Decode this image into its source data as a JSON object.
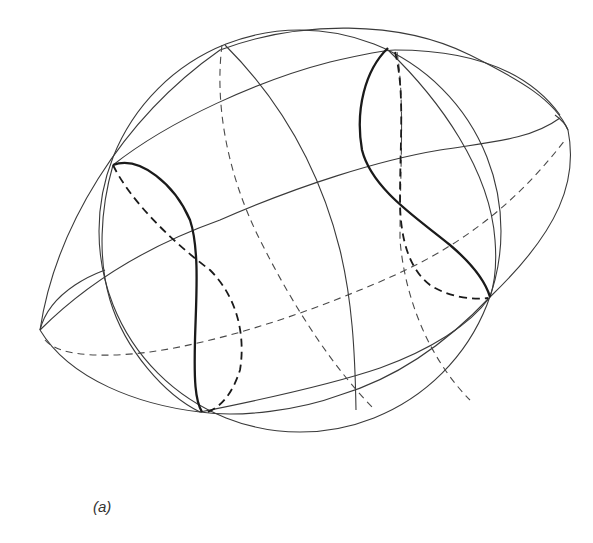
{
  "figure": {
    "caption": "(a)",
    "colors": {
      "background": "#ffffff",
      "line": "#3a3a3a",
      "bold_line": "#1a1a1a"
    },
    "elements": [
      {
        "name": "sphere-outline",
        "style": "solid-thin"
      },
      {
        "name": "ellipsoid-outline",
        "style": "solid-thin"
      },
      {
        "name": "sphere-meridian-front",
        "style": "solid-thin"
      },
      {
        "name": "sphere-meridian-back",
        "style": "dashed-thin"
      },
      {
        "name": "ellipsoid-latitude-lines",
        "style": "solid-thin"
      },
      {
        "name": "ellipsoid-equator-back",
        "style": "dashed-thin"
      },
      {
        "name": "intersection-curve-left",
        "style": "solid-bold + dashed-bold"
      },
      {
        "name": "intersection-curve-right",
        "style": "solid-bold + dashed-bold"
      }
    ]
  }
}
